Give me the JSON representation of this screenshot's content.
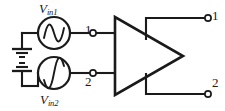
{
  "figure": {
    "name": "differential-amplifier-schematic",
    "background_color": "#ffffff",
    "line_color": "#1a1a1a",
    "width": 225,
    "height": 111
  },
  "sources": {
    "upper": {
      "label_main": "V",
      "label_sub": "in1",
      "symbol": "ac-voltage-source",
      "waveform": "sine"
    },
    "lower": {
      "label_main": "V",
      "label_sub": "in2",
      "symbol": "ac-voltage-source",
      "waveform": "sine-inverted"
    }
  },
  "grounds": {
    "upper_label": "ground",
    "lower_label": "ground"
  },
  "nodes": {
    "input_1": "1",
    "input_2": "2",
    "output_1": "1",
    "output_2": "2"
  },
  "amplifier": {
    "symbol": "triangle-amplifier",
    "label": ""
  }
}
